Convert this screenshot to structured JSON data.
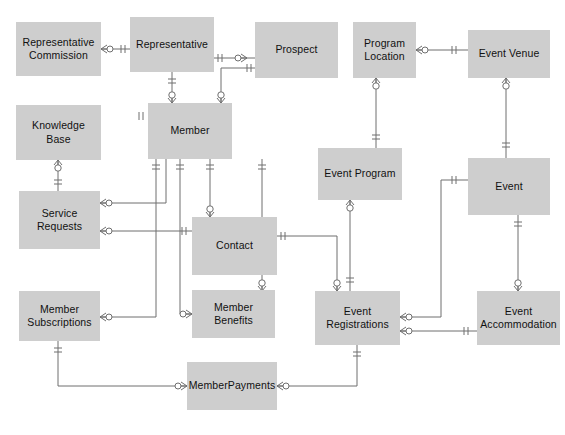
{
  "diagram": {
    "type": "entity-relationship",
    "notation": "crows-foot",
    "canvas": {
      "width": 565,
      "height": 435
    },
    "style": {
      "entity_fill": "#cecece",
      "entity_text": "#111111",
      "line_color": "#6f6f6f",
      "background": "#ffffff"
    }
  },
  "entities": [
    {
      "id": "representative_commission",
      "label": "Representative\nCommission",
      "x": 16,
      "y": 22,
      "w": 85,
      "h": 54
    },
    {
      "id": "representative",
      "label": "Representative",
      "x": 130,
      "y": 17,
      "w": 84,
      "h": 55
    },
    {
      "id": "prospect",
      "label": "Prospect",
      "x": 255,
      "y": 22,
      "w": 83,
      "h": 56
    },
    {
      "id": "program_location",
      "label": "Program\nLocation",
      "x": 353,
      "y": 22,
      "w": 63,
      "h": 56
    },
    {
      "id": "event_venue",
      "label": "Event Venue",
      "x": 468,
      "y": 30,
      "w": 82,
      "h": 48
    },
    {
      "id": "knowledge_base",
      "label": "Knowledge Base",
      "x": 16,
      "y": 105,
      "w": 85,
      "h": 55
    },
    {
      "id": "member",
      "label": "Member",
      "x": 148,
      "y": 103,
      "w": 84,
      "h": 56
    },
    {
      "id": "event_program",
      "label": "Event Program",
      "x": 318,
      "y": 148,
      "w": 84,
      "h": 52
    },
    {
      "id": "event",
      "label": "Event",
      "x": 468,
      "y": 158,
      "w": 82,
      "h": 57
    },
    {
      "id": "service_requests",
      "label": "Service Requests",
      "x": 19,
      "y": 191,
      "w": 81,
      "h": 58
    },
    {
      "id": "contact",
      "label": "Contact",
      "x": 192,
      "y": 217,
      "w": 85,
      "h": 58
    },
    {
      "id": "member_subscriptions",
      "label": "Member\nSubscriptions",
      "x": 19,
      "y": 291,
      "w": 81,
      "h": 50
    },
    {
      "id": "member_benefits",
      "label": "Member Benefits",
      "x": 192,
      "y": 290,
      "w": 83,
      "h": 48
    },
    {
      "id": "event_registrations",
      "label": "Event\nRegistrations",
      "x": 315,
      "y": 291,
      "w": 85,
      "h": 54
    },
    {
      "id": "event_accommodation",
      "label": "Event\nAccommodation",
      "x": 477,
      "y": 291,
      "w": 83,
      "h": 54
    },
    {
      "id": "memberpayments",
      "label": "MemberPayments",
      "x": 187,
      "y": 362,
      "w": 90,
      "h": 48
    }
  ],
  "relationships": [
    {
      "from": "representative_commission",
      "to": "representative",
      "from_card": "zero-or-many",
      "to_card": "one-only"
    },
    {
      "from": "representative",
      "to": "prospect",
      "from_card": "one-only",
      "to_card": "zero-or-many"
    },
    {
      "from": "representative",
      "to": "member",
      "from_card": "one-only",
      "to_card": "zero-or-many"
    },
    {
      "from": "prospect",
      "to": "member",
      "from_card": "one-only",
      "to_card": "zero-or-many"
    },
    {
      "from": "program_location",
      "to": "event_venue",
      "from_card": "zero-or-many",
      "to_card": "one-only"
    },
    {
      "from": "program_location",
      "to": "event_program",
      "from_card": "zero-or-many",
      "to_card": "one-only"
    },
    {
      "from": "event_venue",
      "to": "event",
      "from_card": "zero-or-many",
      "to_card": "one-only"
    },
    {
      "from": "knowledge_base",
      "to": "service_requests",
      "from_card": "zero-or-many",
      "to_card": "one-only"
    },
    {
      "from": "service_requests",
      "to": "member",
      "from_card": "zero-or-many",
      "to_card": "one-only"
    },
    {
      "from": "service_requests",
      "to": "contact",
      "from_card": "zero-or-many",
      "to_card": "one-only"
    },
    {
      "from": "member",
      "to": "contact",
      "from_card": "one-only",
      "to_card": "zero-or-many"
    },
    {
      "from": "member",
      "to": "member_benefits",
      "from_card": "one-only",
      "to_card": "zero-or-many"
    },
    {
      "from": "member",
      "to": "event_registrations",
      "from_card": "one-only",
      "to_card": "zero-or-many"
    },
    {
      "from": "member_subscriptions",
      "to": "member",
      "from_card": "zero-or-many",
      "to_card": "one-only"
    },
    {
      "from": "member_subscriptions",
      "to": "memberpayments",
      "from_card": "one-only",
      "to_card": "zero-or-many"
    },
    {
      "from": "contact",
      "to": "event_registrations",
      "from_card": "one-only",
      "to_card": "zero-or-many"
    },
    {
      "from": "event_program",
      "to": "event_registrations",
      "from_card": "zero-or-many",
      "to_card": "one-only"
    },
    {
      "from": "event",
      "to": "event_registrations",
      "from_card": "one-only",
      "to_card": "zero-or-many"
    },
    {
      "from": "event",
      "to": "event_accommodation",
      "from_card": "one-only",
      "to_card": "zero-or-many"
    },
    {
      "from": "event_registrations",
      "to": "event_accommodation",
      "from_card": "zero-or-many",
      "to_card": "one-only"
    },
    {
      "from": "event_registrations",
      "to": "memberpayments",
      "from_card": "one-only",
      "to_card": "zero-or-many"
    }
  ]
}
